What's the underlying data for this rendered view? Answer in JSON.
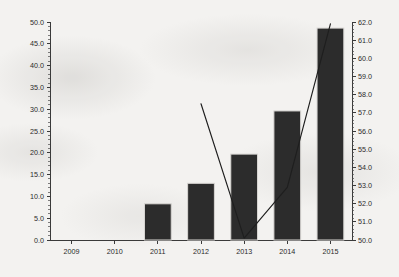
{
  "chart_data": {
    "type": "bar",
    "title": "",
    "subtitle": "",
    "xlabel": "",
    "ylabel": "",
    "y2label": "",
    "categories": [
      "2009",
      "2010",
      "2011",
      "2012",
      "2013",
      "2014",
      "2015"
    ],
    "grid": false,
    "legend": "none",
    "ylim": [
      0.0,
      50.0
    ],
    "ytick_step": 5.0,
    "yticks": [
      "0.0",
      "5.0",
      "10.0",
      "15.0",
      "20.0",
      "25.0",
      "30.0",
      "35.0",
      "40.0",
      "45.0",
      "50.0"
    ],
    "y2lim": [
      50.0,
      62.0
    ],
    "y2tick_step": 1.0,
    "y2ticks": [
      "50.0",
      "51.0",
      "52.0",
      "53.0",
      "54.0",
      "55.0",
      "56.0",
      "57.0",
      "58.0",
      "59.0",
      "60.0",
      "61.0",
      "62.0"
    ],
    "series": [
      {
        "name": "bars",
        "type": "bar",
        "axis": "left",
        "color": "#2c2c2c",
        "values": [
          0.0,
          0.0,
          8.3,
          13.0,
          19.7,
          29.6,
          48.6
        ]
      },
      {
        "name": "line",
        "type": "line",
        "axis": "right",
        "color": "#1e1e1e",
        "x": [
          "2012",
          "2013",
          "2014",
          "2015"
        ],
        "values": [
          57.5,
          50.1,
          52.9,
          61.9
        ]
      }
    ]
  },
  "axes": {
    "left_ticks": [
      "50.0",
      "45.0",
      "40.0",
      "35.0",
      "30.0",
      "25.0",
      "20.0",
      "15.0",
      "10.0",
      "5.0",
      "0.0"
    ],
    "right_ticks": [
      "62.0",
      "61.0",
      "60.0",
      "59.0",
      "58.0",
      "57.0",
      "56.0",
      "55.0",
      "54.0",
      "53.0",
      "52.0",
      "51.0",
      "50.0"
    ],
    "x_ticks": [
      "2009",
      "2010",
      "2011",
      "2012",
      "2013",
      "2014",
      "2015"
    ]
  },
  "colors": {
    "background": "#f3f2f0",
    "bar_fill": "#2c2c2c",
    "bar_stroke": "#d8d6d3",
    "line_stroke": "#1e1e1e",
    "axis": "#3a3a3a",
    "text": "#2a2a2a"
  }
}
